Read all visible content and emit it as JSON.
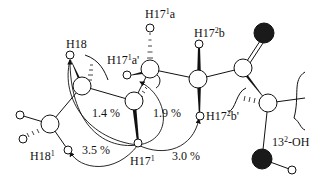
{
  "diagram": {
    "type": "molecular-fragment-noe",
    "labels": {
      "h18": "H18",
      "h17_1a": {
        "base": "H17",
        "sup": "1",
        "tail": "a"
      },
      "h17_1a_prime": {
        "base": "H17",
        "sup": "1",
        "tail": "a'"
      },
      "h17_2b": {
        "base": "H17",
        "sup": "2",
        "tail": "b"
      },
      "h17_2b_prime": {
        "base": "H17",
        "sup": "2",
        "tail": "b'"
      },
      "h18_1": {
        "base": "H18",
        "sup": "1",
        "tail": ""
      },
      "h17_1": {
        "base": "H17",
        "sup": "1",
        "tail": ""
      },
      "oh_13_2": {
        "base": "13",
        "sup": "2",
        "tail": "-OH"
      }
    },
    "noe_percentages": {
      "h18_to_h17_1": "1.4 %",
      "h17_1a_prime_to_h17_1": "1.9 %",
      "h18_1_to_h17_1": "3.5 %",
      "h17_1_to_h17_2b_prime": "3.0 %"
    },
    "colors": {
      "line": "#111111",
      "oxygen": "#1a1a1a",
      "background": "#ffffff"
    }
  }
}
